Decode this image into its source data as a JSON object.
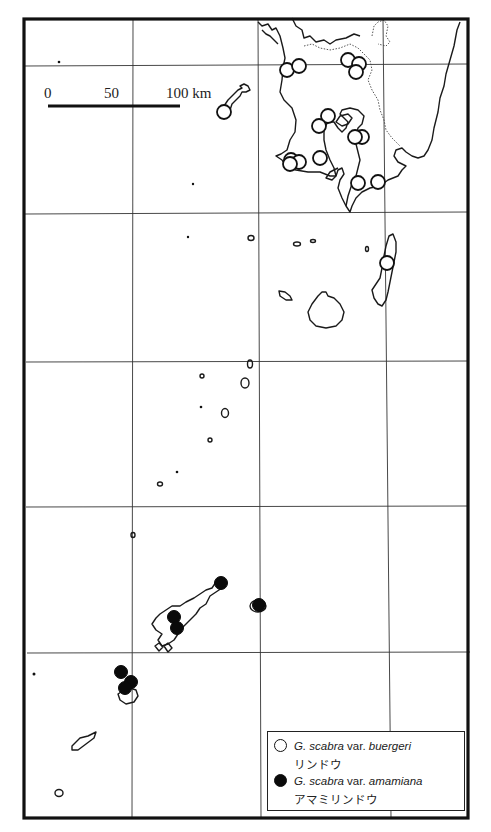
{
  "scale_bar": {
    "ticks": [
      "0",
      "50",
      "100 km"
    ],
    "unit": "km"
  },
  "legend": {
    "items": [
      {
        "symbol": "open-circle",
        "genus": "G. scabra",
        "rank": "var.",
        "variety": "buergeri",
        "japanese_name": "リンドウ"
      },
      {
        "symbol": "filled-circle",
        "genus": "G. scabra",
        "rank": "var.",
        "variety": "amamiana",
        "japanese_name": "アマミリンドウ"
      }
    ]
  },
  "colors": {
    "ink": "#111111",
    "background": "#ffffff"
  },
  "map": {
    "grid_vertical_x": [
      133,
      261,
      388
    ],
    "grid_horizontal_y": [
      66,
      214,
      362,
      507,
      653
    ],
    "open_points": [
      [
        287,
        70
      ],
      [
        299,
        66
      ],
      [
        348,
        60
      ],
      [
        359,
        64
      ],
      [
        356,
        72
      ],
      [
        224,
        112
      ],
      [
        328,
        116
      ],
      [
        319,
        126
      ],
      [
        362,
        137
      ],
      [
        355,
        137
      ],
      [
        320,
        158
      ],
      [
        291,
        160
      ],
      [
        299,
        162
      ],
      [
        290,
        164
      ],
      [
        358,
        183
      ],
      [
        378,
        182
      ],
      [
        387,
        263
      ]
    ],
    "filled_points": [
      [
        221,
        583
      ],
      [
        259,
        605
      ],
      [
        174,
        617
      ],
      [
        177,
        628
      ],
      [
        121,
        672
      ],
      [
        131,
        682
      ],
      [
        125,
        688
      ]
    ]
  }
}
